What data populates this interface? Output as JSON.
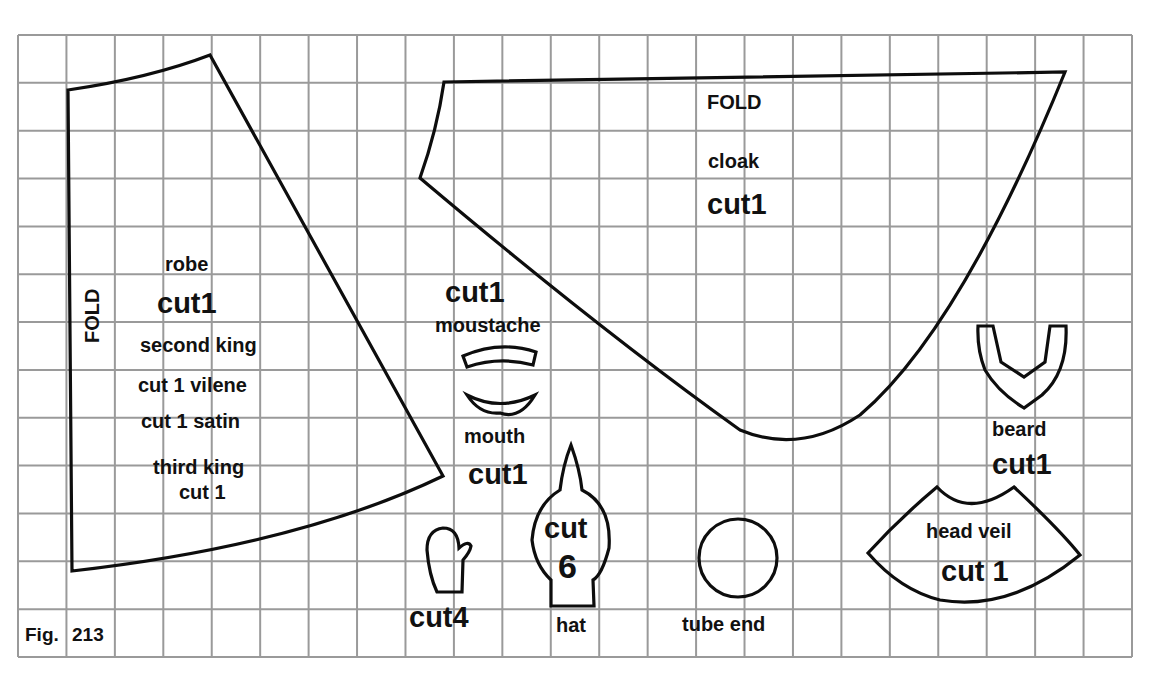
{
  "figure": {
    "caption_fig": "Fig.",
    "caption_num": "213",
    "grid": {
      "columns": 23,
      "rows": 13,
      "line_color": "#9a9a9a"
    },
    "outline_color": "#0d0d0d"
  },
  "pieces": {
    "robe": {
      "fold_label": "FOLD",
      "name": "robe",
      "cut": "cut1",
      "second_king": "second king",
      "cut_vilene": "cut 1 vilene",
      "cut_satin": "cut 1 satin",
      "third_king": "third king",
      "third_king_cut": "cut 1"
    },
    "cloak": {
      "fold_label": "FOLD",
      "name": "cloak",
      "cut": "cut1"
    },
    "moustache": {
      "cut": "cut1",
      "name": "moustache"
    },
    "mouth": {
      "name": "mouth",
      "cut": "cut1"
    },
    "mitten": {
      "cut": "cut4"
    },
    "hat": {
      "cut_word": "cut",
      "cut_count": "6",
      "name": "hat"
    },
    "tube_end": {
      "name": "tube end"
    },
    "beard": {
      "name": "beard",
      "cut": "cut1"
    },
    "head_veil": {
      "name": "head veil",
      "cut": "cut 1"
    }
  }
}
